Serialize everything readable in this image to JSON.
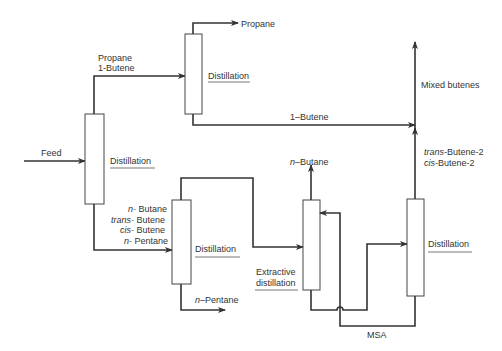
{
  "diagram": {
    "type": "process-flow",
    "colors": {
      "line": "#333333",
      "background": "#ffffff"
    },
    "feed": {
      "label": "Feed"
    },
    "columns": [
      {
        "id": "col1",
        "label": "Distillation"
      },
      {
        "id": "col2",
        "label": "Distillation"
      },
      {
        "id": "col3",
        "label": "Distillation"
      },
      {
        "id": "col4",
        "label_line1": "Extractive",
        "label_line2": "distillation"
      },
      {
        "id": "col5",
        "label": "Distillation"
      }
    ],
    "streams": {
      "col1_top": {
        "line1": "Propane",
        "line2": "1-Butene"
      },
      "col2_top": "Propane",
      "col2_bottom": "1–Butene",
      "mixed": "Mixed butenes",
      "col5_top": {
        "line1_ital": "trans",
        "line1_rest": "-Butene-2",
        "line2_ital": "cis",
        "line2_rest": "-Butene-2"
      },
      "col1_bottom": [
        {
          "ital": "n-",
          "rest": " Butane"
        },
        {
          "ital": "trans-",
          "rest": " Butene"
        },
        {
          "ital": "cis-",
          "rest": " Butene"
        },
        {
          "ital": "n-",
          "rest": " Pentane"
        }
      ],
      "col4_top": {
        "ital": "n",
        "rest": "–Butane"
      },
      "col3_bottom": {
        "ital": "n",
        "rest": "–Pentane"
      },
      "solvent": "MSA"
    }
  }
}
